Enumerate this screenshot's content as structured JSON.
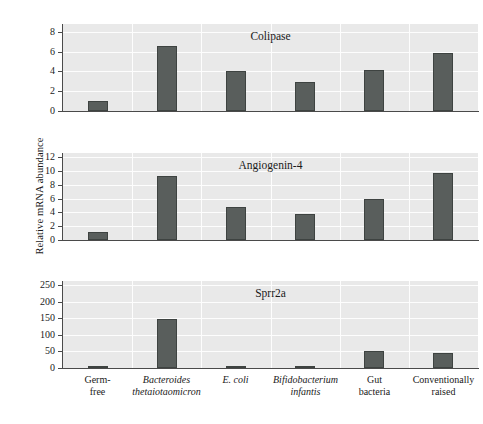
{
  "figure": {
    "ylabel": "Relative mRNA abundance",
    "background": "#ffffff",
    "plot_background": "#e9e9e9",
    "bar_color": "#595e5c",
    "gridline_color": "#fdfdfd",
    "axis_color": "#4a4a4a"
  },
  "categories": [
    {
      "line1": "Germ-",
      "line2": "free",
      "italic": false
    },
    {
      "line1": "Bacteroides",
      "line2": "thetaiotaomicron",
      "italic": true
    },
    {
      "line1": "E. coli",
      "line2": "",
      "italic": true
    },
    {
      "line1": "Bifidobacterium",
      "line2": "infantis",
      "italic": true
    },
    {
      "line1": "Gut",
      "line2": "bacteria",
      "italic": false
    },
    {
      "line1": "Conventionally",
      "line2": "raised",
      "italic": false
    }
  ],
  "chart_data": [
    {
      "type": "bar",
      "title": "Colipase",
      "xlabel": "",
      "ylabel": "Relative mRNA abundance",
      "categories": [
        "Germ-free",
        "Bacteroides thetaiotaomicron",
        "E. coli",
        "Bifidobacterium infantis",
        "Gut bacteria",
        "Conventionally raised"
      ],
      "values": [
        1.0,
        6.6,
        4.0,
        2.95,
        4.15,
        5.85
      ],
      "ylim": [
        0,
        8.8
      ],
      "yticks": [
        0,
        2,
        4,
        6,
        8
      ],
      "ytick_labels": [
        "0",
        "2",
        "4",
        "6",
        "8"
      ],
      "grid": true,
      "legend": "none"
    },
    {
      "type": "bar",
      "title": "Angiogenin-4",
      "xlabel": "",
      "ylabel": "Relative mRNA abundance",
      "categories": [
        "Germ-free",
        "Bacteroides thetaiotaomicron",
        "E. coli",
        "Bifidobacterium infantis",
        "Gut bacteria",
        "Conventionally raised"
      ],
      "values": [
        1.2,
        9.2,
        4.8,
        3.8,
        5.9,
        9.7
      ],
      "ylim": [
        0,
        12.6
      ],
      "yticks": [
        0,
        2,
        4,
        6,
        8,
        10,
        12
      ],
      "ytick_labels": [
        "0",
        "2",
        "4",
        "6",
        "8",
        "10",
        "12"
      ],
      "grid": true,
      "legend": "none"
    },
    {
      "type": "bar",
      "title": "Sprr2a",
      "xlabel": "",
      "ylabel": "Relative mRNA abundance",
      "categories": [
        "Germ-free",
        "Bacteroides thetaiotaomicron",
        "E. coli",
        "Bifidobacterium infantis",
        "Gut bacteria",
        "Conventionally raised"
      ],
      "values": [
        3,
        148,
        4,
        3,
        50,
        45
      ],
      "ylim": [
        0,
        262
      ],
      "yticks": [
        0,
        50,
        100,
        150,
        200,
        250
      ],
      "ytick_labels": [
        "0",
        "50",
        "100",
        "150",
        "200",
        "250"
      ],
      "grid": true,
      "legend": "none"
    }
  ]
}
